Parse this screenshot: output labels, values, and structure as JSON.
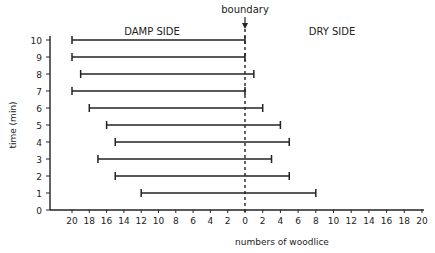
{
  "chart_data": {
    "type": "bar",
    "subtype": "horizontal-range",
    "title": "",
    "xlabel": "numbers of woodlice",
    "ylabel": "time (min)",
    "annotations": {
      "boundary": "boundary",
      "left_region": "DAMP SIDE",
      "right_region": "DRY SIDE"
    },
    "x_left_ticks": [
      20,
      18,
      16,
      14,
      12,
      10,
      8,
      6,
      4,
      2
    ],
    "x_center_tick": 0,
    "x_right_ticks": [
      2,
      4,
      6,
      8,
      10,
      12,
      14,
      16,
      18,
      20
    ],
    "y_ticks": [
      0,
      1,
      2,
      3,
      4,
      5,
      6,
      7,
      8,
      9,
      10
    ],
    "xlim_damp": [
      0,
      20
    ],
    "xlim_dry": [
      0,
      20
    ],
    "ylim": [
      0,
      10
    ],
    "grid": false,
    "categories": [
      1,
      2,
      3,
      4,
      5,
      6,
      7,
      8,
      9,
      10
    ],
    "series": [
      {
        "name": "damp side",
        "values": [
          12,
          15,
          17,
          15,
          16,
          18,
          20,
          19,
          20,
          20
        ]
      },
      {
        "name": "dry side",
        "values": [
          8,
          5,
          3,
          5,
          4,
          2,
          0,
          1,
          0,
          0
        ]
      }
    ]
  }
}
